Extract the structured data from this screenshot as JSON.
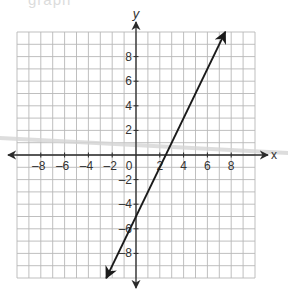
{
  "header": {
    "cropped_text": "graph"
  },
  "axes": {
    "x_label": "x",
    "y_label": "y",
    "origin_label": "0",
    "x_tick_labels": [
      "-8",
      "-6",
      "-4",
      "-2",
      "2",
      "4",
      "6",
      "8"
    ],
    "y_tick_labels": [
      "8",
      "6",
      "4",
      "2",
      "-2",
      "-4",
      "-6",
      "-8"
    ]
  },
  "chart_data": {
    "type": "line",
    "title": "",
    "xlabel": "x",
    "ylabel": "y",
    "xlim": [
      -10,
      10
    ],
    "ylim": [
      -10,
      10
    ],
    "grid": true,
    "grid_step": 1,
    "x_ticks": [
      -8,
      -6,
      -4,
      -2,
      0,
      2,
      4,
      6,
      8
    ],
    "y_ticks": [
      -8,
      -6,
      -4,
      -2,
      2,
      4,
      6,
      8
    ],
    "series": [
      {
        "name": "y = 2x - 5",
        "slope": 2,
        "intercept": -5,
        "x": [
          -2.5,
          0,
          2.5,
          7.5
        ],
        "y": [
          -10,
          -5,
          0,
          10
        ],
        "arrows_both_ends": true
      }
    ]
  },
  "colors": {
    "grid": "#b8b8b8",
    "axis": "#2a2a2a",
    "line": "#1a1a1a",
    "label": "#333333",
    "smear": "#d4d4d4"
  }
}
